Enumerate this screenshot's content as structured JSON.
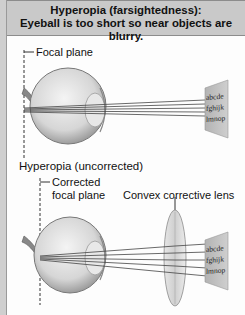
{
  "header": {
    "title_line1": "Hyperopia (farsightedness):",
    "title_line2": "Eyeball is too short so near objects are blurry."
  },
  "top_panel": {
    "focal_plane_label": "Focal plane",
    "caption": "Hyperopia (uncorrected)",
    "chart_lines": [
      "abcde",
      "fghijk",
      "lmnop"
    ]
  },
  "bottom_panel": {
    "focal_plane_label_line1": "Corrected",
    "focal_plane_label_line2": "focal plane",
    "lens_label": "Convex corrective lens",
    "chart_lines": [
      "abcde",
      "fghijk",
      "lmnop"
    ]
  },
  "colors": {
    "header_bg": "#c9c9c9",
    "eye_fill": "#d9d9d9",
    "card_fill": "#bdbdbd"
  }
}
